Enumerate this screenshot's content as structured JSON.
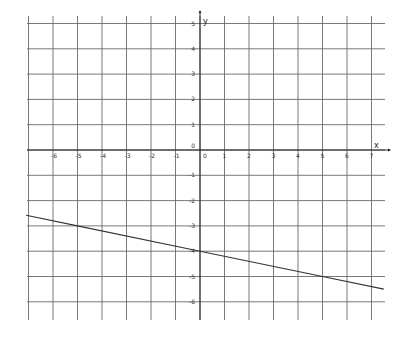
{
  "chart_data": {
    "type": "line",
    "title": "",
    "xlabel": "x",
    "ylabel": "y",
    "xlim": [
      -7.1,
      7.5
    ],
    "ylim": [
      -6.7,
      5.2
    ],
    "grid": true,
    "x_ticks": [
      -6,
      -5,
      -4,
      -3,
      -2,
      -1,
      0,
      1,
      2,
      3,
      4,
      5,
      6,
      7
    ],
    "y_ticks": [
      -6,
      -5,
      -4,
      -3,
      -2,
      -1,
      0,
      1,
      2,
      3,
      4,
      5
    ],
    "series": [
      {
        "name": "line",
        "equation": "y = -x/5 - 4",
        "x": [
          -7.1,
          -5,
          0,
          5,
          7.5
        ],
        "y": [
          -2.58,
          -3,
          -4,
          -5,
          -5.5
        ]
      }
    ],
    "colors": {
      "grid": "#6a6a6a",
      "axis": "#222222",
      "line": "#333333"
    }
  }
}
